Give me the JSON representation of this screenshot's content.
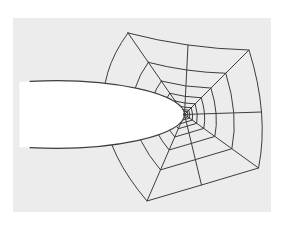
{
  "figure": {
    "canvas": {
      "width": 288,
      "height": 227,
      "background_color": "#ffffff"
    },
    "panel": {
      "x": 13,
      "y": 18,
      "width": 258,
      "height": 194,
      "fill": "#ececec"
    },
    "line": {
      "color": "#3d3d3d",
      "width": 1,
      "ellipse_width": 1.1
    },
    "ellipse": {
      "cx": 55,
      "cy": 114.5,
      "rx": 129.5,
      "ry": 33.8,
      "fill": "#ffffff",
      "fill_left_edge_x": 19.5,
      "outline_start_x": 30,
      "tip": [
        184.5,
        114.5
      ]
    },
    "web": {
      "center": [
        184.5,
        114.5
      ],
      "center_dot_radius": 1.6,
      "outer_points": {
        "top_left": [
          128,
          33
        ],
        "top": [
          188,
          45
        ],
        "top_right": [
          249,
          50
        ],
        "right": [
          261.5,
          112
        ],
        "bottom_right": [
          258.5,
          168
        ],
        "bottom": [
          201.5,
          185
        ],
        "bottom_left": [
          147,
          201
        ],
        "left": [
          104,
          114
        ]
      },
      "ring_fractions": [
        1,
        0.64,
        0.41,
        0.26,
        0.165,
        0.105,
        0.067,
        0.043
      ],
      "radial_count": 8,
      "ring_count": 8
    }
  }
}
